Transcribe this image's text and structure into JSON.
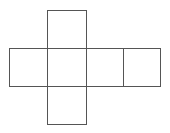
{
  "diagram": {
    "type": "cube-net",
    "stroke_color": "#555555",
    "background": "#ffffff",
    "faces": [
      {
        "name": "top",
        "x": 47,
        "y": 10,
        "w": 39,
        "h": 38
      },
      {
        "name": "left",
        "x": 9,
        "y": 48,
        "w": 38,
        "h": 38
      },
      {
        "name": "center",
        "x": 47,
        "y": 48,
        "w": 39,
        "h": 38
      },
      {
        "name": "right",
        "x": 86,
        "y": 48,
        "w": 37,
        "h": 38
      },
      {
        "name": "far-right",
        "x": 123,
        "y": 48,
        "w": 37,
        "h": 38
      },
      {
        "name": "bottom",
        "x": 47,
        "y": 86,
        "w": 39,
        "h": 38
      }
    ]
  }
}
